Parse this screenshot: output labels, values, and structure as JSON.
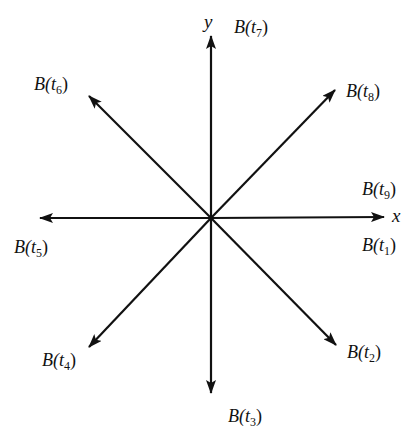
{
  "diagram": {
    "title": "",
    "origin": {
      "x": 211,
      "y": 218
    },
    "stroke_color": "#111111",
    "axes": {
      "x_label": "x",
      "y_label": "y"
    },
    "vectors": [
      {
        "id": "t1",
        "label_base": "B(t",
        "subscript": "1",
        "label_end": ")",
        "tip": {
          "x": 384,
          "y": 217
        },
        "label_pos": {
          "x": 362,
          "y": 236
        }
      },
      {
        "id": "t2",
        "label_base": "B(t",
        "subscript": "2",
        "label_end": ")",
        "tip": {
          "x": 336,
          "y": 345
        },
        "label_pos": {
          "x": 347,
          "y": 343
        }
      },
      {
        "id": "t3",
        "label_base": "B(t",
        "subscript": "3",
        "label_end": ")",
        "tip": {
          "x": 211,
          "y": 393
        },
        "label_pos": {
          "x": 228,
          "y": 407
        }
      },
      {
        "id": "t4",
        "label_base": "B(t",
        "subscript": "4",
        "label_end": ")",
        "tip": {
          "x": 89,
          "y": 347
        },
        "label_pos": {
          "x": 42,
          "y": 351
        }
      },
      {
        "id": "t5",
        "label_base": "B(t",
        "subscript": "5",
        "label_end": ")",
        "tip": {
          "x": 40,
          "y": 218
        },
        "label_pos": {
          "x": 14,
          "y": 238
        }
      },
      {
        "id": "t6",
        "label_base": "B(t",
        "subscript": "6",
        "label_end": ")",
        "tip": {
          "x": 89,
          "y": 96
        },
        "label_pos": {
          "x": 34,
          "y": 75
        }
      },
      {
        "id": "t7",
        "label_base": "B(t",
        "subscript": "7",
        "label_end": ")",
        "tip": {
          "x": 211,
          "y": 36
        },
        "label_pos": {
          "x": 234,
          "y": 18
        }
      },
      {
        "id": "t8",
        "label_base": "B(t",
        "subscript": "8",
        "label_end": ")",
        "tip": {
          "x": 335,
          "y": 90
        },
        "label_pos": {
          "x": 346,
          "y": 82
        }
      },
      {
        "id": "t9",
        "label_base": "B(t",
        "subscript": "9",
        "label_end": ")",
        "tip": {
          "x": 384,
          "y": 217
        },
        "label_pos": {
          "x": 362,
          "y": 180
        }
      }
    ]
  }
}
